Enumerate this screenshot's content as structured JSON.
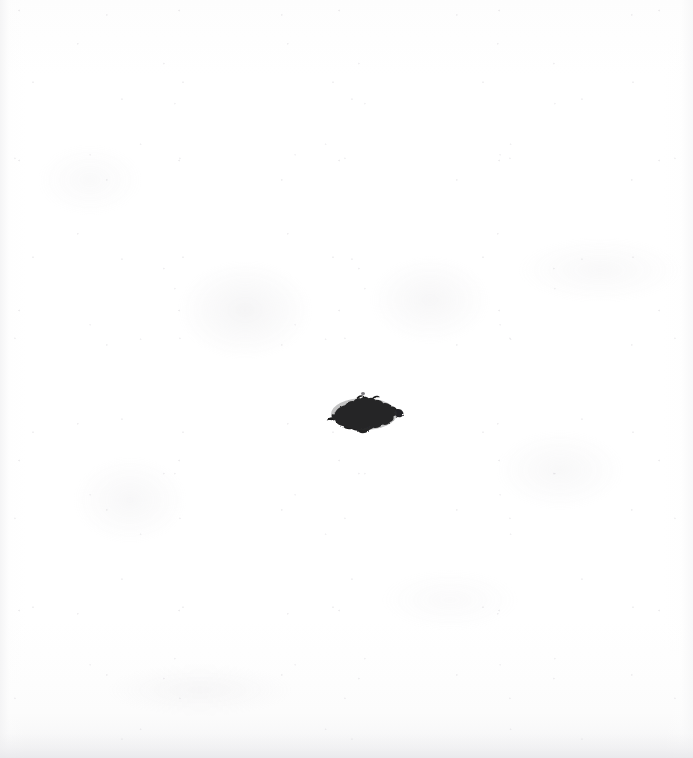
{
  "document": {
    "title": "Scanned blank page with ink blot",
    "medium": "paper-scan",
    "width_px": 693,
    "height_px": 758,
    "background_color": "#ffffff",
    "paper_tone": "#fdfdfd",
    "edge_band_color": "#f3f3f4",
    "bottom_band_color": "#e8e8eb"
  },
  "artifacts": {
    "ink_blot": {
      "label": "ink-blot",
      "description": "Single irregular dark ink blot near the center of the page",
      "color": "#1e1e1e",
      "edge_color": "#2a2a2c",
      "x_px": 332,
      "y_px": 397,
      "width_px": 66,
      "height_px": 38
    },
    "ink_speck": {
      "label": "ink-speck",
      "description": "Tiny faint speck just above the main blot",
      "color": "#78767a",
      "x_px": 361,
      "y_px": 392
    },
    "ghosting": {
      "label": "bleed-through",
      "description": "Very faint grey mottling and show-through from the reverse side",
      "color": "#c6c4ca",
      "opacity": 0.28
    },
    "grain": {
      "label": "paper-grain",
      "description": "Fine speckle noise from the scan",
      "color": "#bdbbc1"
    }
  }
}
